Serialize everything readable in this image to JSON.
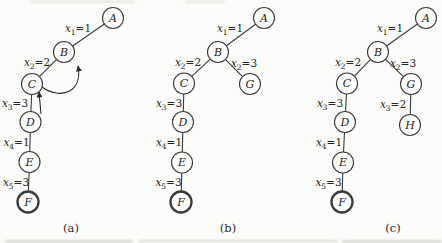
{
  "figure": {
    "colors": {
      "background": "#fbfbf9",
      "line": "#3a3a3a",
      "arrow": "#2b2b2b",
      "text": "#242424",
      "node_fill": "#fdfdfc"
    },
    "node_radius": 10.5,
    "panels": [
      {
        "id": "a",
        "caption": "(a)",
        "caption_x": 71,
        "caption_y": 228,
        "nodes": [
          {
            "id": "A",
            "label": "A",
            "x": 113,
            "y": 18,
            "bold": false
          },
          {
            "id": "B",
            "label": "B",
            "x": 64,
            "y": 52,
            "bold": false
          },
          {
            "id": "C",
            "label": "C",
            "x": 32,
            "y": 84,
            "bold": false
          },
          {
            "id": "D",
            "label": "D",
            "x": 30.5,
            "y": 122,
            "bold": false
          },
          {
            "id": "E",
            "label": "E",
            "x": 29.5,
            "y": 162,
            "bold": false
          },
          {
            "id": "F",
            "label": "F",
            "x": 28,
            "y": 202,
            "bold": true
          }
        ],
        "edges": [
          {
            "from": "A",
            "to": "B",
            "label": {
              "var": "x",
              "sub": "1",
              "val": "1"
            },
            "lx": 78,
            "ly": 29
          },
          {
            "from": "B",
            "to": "C",
            "label": {
              "var": "x",
              "sub": "2",
              "val": "2"
            },
            "lx": 37,
            "ly": 62.5
          },
          {
            "from": "C",
            "to": "D",
            "label": {
              "var": "x",
              "sub": "3",
              "val": "3"
            },
            "lx": 15,
            "ly": 103.5
          },
          {
            "from": "D",
            "to": "E",
            "label": {
              "var": "x",
              "sub": "4",
              "val": "1"
            },
            "lx": 16.5,
            "ly": 142.5
          },
          {
            "from": "E",
            "to": "F",
            "label": {
              "var": "x",
              "sub": "5",
              "val": "3"
            },
            "lx": 16,
            "ly": 183
          }
        ],
        "arrows": [
          {
            "name": "backjump-arrow-d-to-c",
            "path": "M 41 114 L 39 92"
          },
          {
            "name": "backjump-arrow-c-to-b",
            "path": "M 42 87 C 60 100, 83 93, 78 66"
          }
        ]
      },
      {
        "id": "b",
        "caption": "(b)",
        "caption_x": 228,
        "caption_y": 228,
        "nodes": [
          {
            "id": "A",
            "label": "A",
            "x": 264,
            "y": 18,
            "bold": false
          },
          {
            "id": "B",
            "label": "B",
            "x": 218,
            "y": 52,
            "bold": false
          },
          {
            "id": "C",
            "label": "C",
            "x": 184,
            "y": 83.5,
            "bold": false
          },
          {
            "id": "G",
            "label": "G",
            "x": 250,
            "y": 84,
            "bold": false
          },
          {
            "id": "D",
            "label": "D",
            "x": 183,
            "y": 122,
            "bold": false
          },
          {
            "id": "E",
            "label": "E",
            "x": 182,
            "y": 162.5,
            "bold": false
          },
          {
            "id": "F",
            "label": "F",
            "x": 181,
            "y": 202,
            "bold": true
          }
        ],
        "edges": [
          {
            "from": "A",
            "to": "B",
            "label": {
              "var": "x",
              "sub": "1",
              "val": "1"
            },
            "lx": 230,
            "ly": 29
          },
          {
            "from": "B",
            "to": "C",
            "label": {
              "var": "x",
              "sub": "2",
              "val": "2"
            },
            "lx": 188,
            "ly": 62.5
          },
          {
            "from": "B",
            "to": "G",
            "label": {
              "var": "x",
              "sub": "2",
              "val": "3"
            },
            "lx": 244,
            "ly": 63.5
          },
          {
            "from": "C",
            "to": "D",
            "label": {
              "var": "x",
              "sub": "3",
              "val": "3"
            },
            "lx": 169,
            "ly": 103.5
          },
          {
            "from": "D",
            "to": "E",
            "label": {
              "var": "x",
              "sub": "4",
              "val": "1"
            },
            "lx": 169,
            "ly": 142.5
          },
          {
            "from": "E",
            "to": "F",
            "label": {
              "var": "x",
              "sub": "5",
              "val": "3"
            },
            "lx": 168.5,
            "ly": 183
          }
        ],
        "arrows": []
      },
      {
        "id": "c",
        "caption": "(c)",
        "caption_x": 393,
        "caption_y": 228,
        "nodes": [
          {
            "id": "A",
            "label": "A",
            "x": 426,
            "y": 18,
            "bold": false
          },
          {
            "id": "B",
            "label": "B",
            "x": 378,
            "y": 52,
            "bold": false
          },
          {
            "id": "C",
            "label": "C",
            "x": 347,
            "y": 83.5,
            "bold": false
          },
          {
            "id": "G",
            "label": "G",
            "x": 411,
            "y": 84,
            "bold": false
          },
          {
            "id": "D",
            "label": "D",
            "x": 345,
            "y": 122,
            "bold": false
          },
          {
            "id": "H",
            "label": "H",
            "x": 410,
            "y": 125,
            "bold": false
          },
          {
            "id": "E",
            "label": "E",
            "x": 343,
            "y": 162.5,
            "bold": false
          },
          {
            "id": "F",
            "label": "F",
            "x": 342,
            "y": 202,
            "bold": true
          }
        ],
        "edges": [
          {
            "from": "A",
            "to": "B",
            "label": {
              "var": "x",
              "sub": "1",
              "val": "1"
            },
            "lx": 390,
            "ly": 29
          },
          {
            "from": "B",
            "to": "C",
            "label": {
              "var": "x",
              "sub": "2",
              "val": "2"
            },
            "lx": 348,
            "ly": 62.5
          },
          {
            "from": "B",
            "to": "G",
            "label": {
              "var": "x",
              "sub": "2",
              "val": "3"
            },
            "lx": 403,
            "ly": 63.5
          },
          {
            "from": "C",
            "to": "D",
            "label": {
              "var": "x",
              "sub": "3",
              "val": "3"
            },
            "lx": 330,
            "ly": 103.5
          },
          {
            "from": "G",
            "to": "H",
            "label": {
              "var": "x",
              "sub": "3",
              "val": "2"
            },
            "lx": 393,
            "ly": 104.5
          },
          {
            "from": "D",
            "to": "E",
            "label": {
              "var": "x",
              "sub": "4",
              "val": "1"
            },
            "lx": 329,
            "ly": 142.5
          },
          {
            "from": "E",
            "to": "F",
            "label": {
              "var": "x",
              "sub": "5",
              "val": "3"
            },
            "lx": 328.5,
            "ly": 183
          }
        ],
        "arrows": []
      }
    ]
  }
}
